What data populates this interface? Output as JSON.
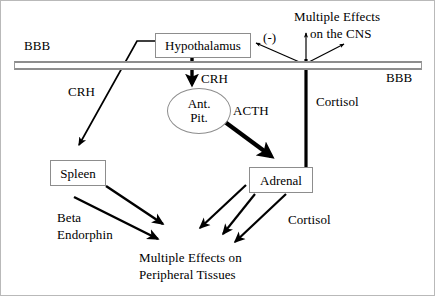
{
  "diagram": {
    "barrier": {
      "label_left": "BBB",
      "label_right": "BBB",
      "color": "#8e8e8e"
    },
    "nodes": [
      {
        "id": "hypothalamus",
        "label": "Hypothalamus",
        "shape": "box"
      },
      {
        "id": "ant-pit",
        "label_line1": "Ant.",
        "label_line2": "Pit.",
        "shape": "ellipse"
      },
      {
        "id": "spleen",
        "label": "Spleen",
        "shape": "box"
      },
      {
        "id": "adrenal",
        "label": "Adrenal",
        "shape": "box"
      }
    ],
    "labels": {
      "crh_left": "CRH",
      "crh_center": "CRH",
      "acth": "ACTH",
      "cortisol_upper": "Cortisol",
      "cortisol_lower": "Cortisol",
      "negative_feedback": "(-)",
      "beta_endorphin_line1": "Beta",
      "beta_endorphin_line2": "Endorphin",
      "cns_line1": "Multiple Effects",
      "cns_line2": "on the CNS",
      "peripheral_line1": "Multiple Effects on",
      "peripheral_line2": "Peripheral Tissues"
    },
    "arrow_color": "#000000"
  }
}
